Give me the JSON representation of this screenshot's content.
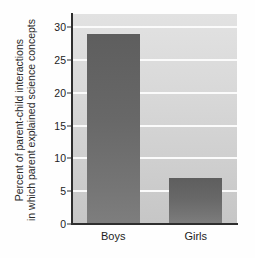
{
  "chart_data": {
    "type": "bar",
    "title": "",
    "xlabel": "",
    "ylabel_lines": [
      "Percent of parent-child interactions",
      "in which parent explained science concepts"
    ],
    "categories": [
      "Boys",
      "Girls"
    ],
    "values": [
      29,
      7
    ],
    "ylim": [
      0,
      32
    ],
    "yticks": [
      0,
      5,
      10,
      15,
      20,
      25,
      30
    ],
    "ytick_labels": [
      "0",
      "5",
      "10",
      "15",
      "20",
      "25",
      "30"
    ],
    "grid": true,
    "gridlines_at": [
      5,
      10,
      15,
      20,
      25,
      30
    ],
    "legend": null,
    "colors": {
      "bar_top": "#5e5e5e",
      "bar_bottom": "#7e7e7e",
      "plot_background_top": "#e2e2e2",
      "plot_background_bottom": "#c6c6c6",
      "gridline": "#fbfbfb",
      "axis": "#2e2e2e",
      "text": "#1c1c1c",
      "page_background": "#ffffff"
    }
  }
}
